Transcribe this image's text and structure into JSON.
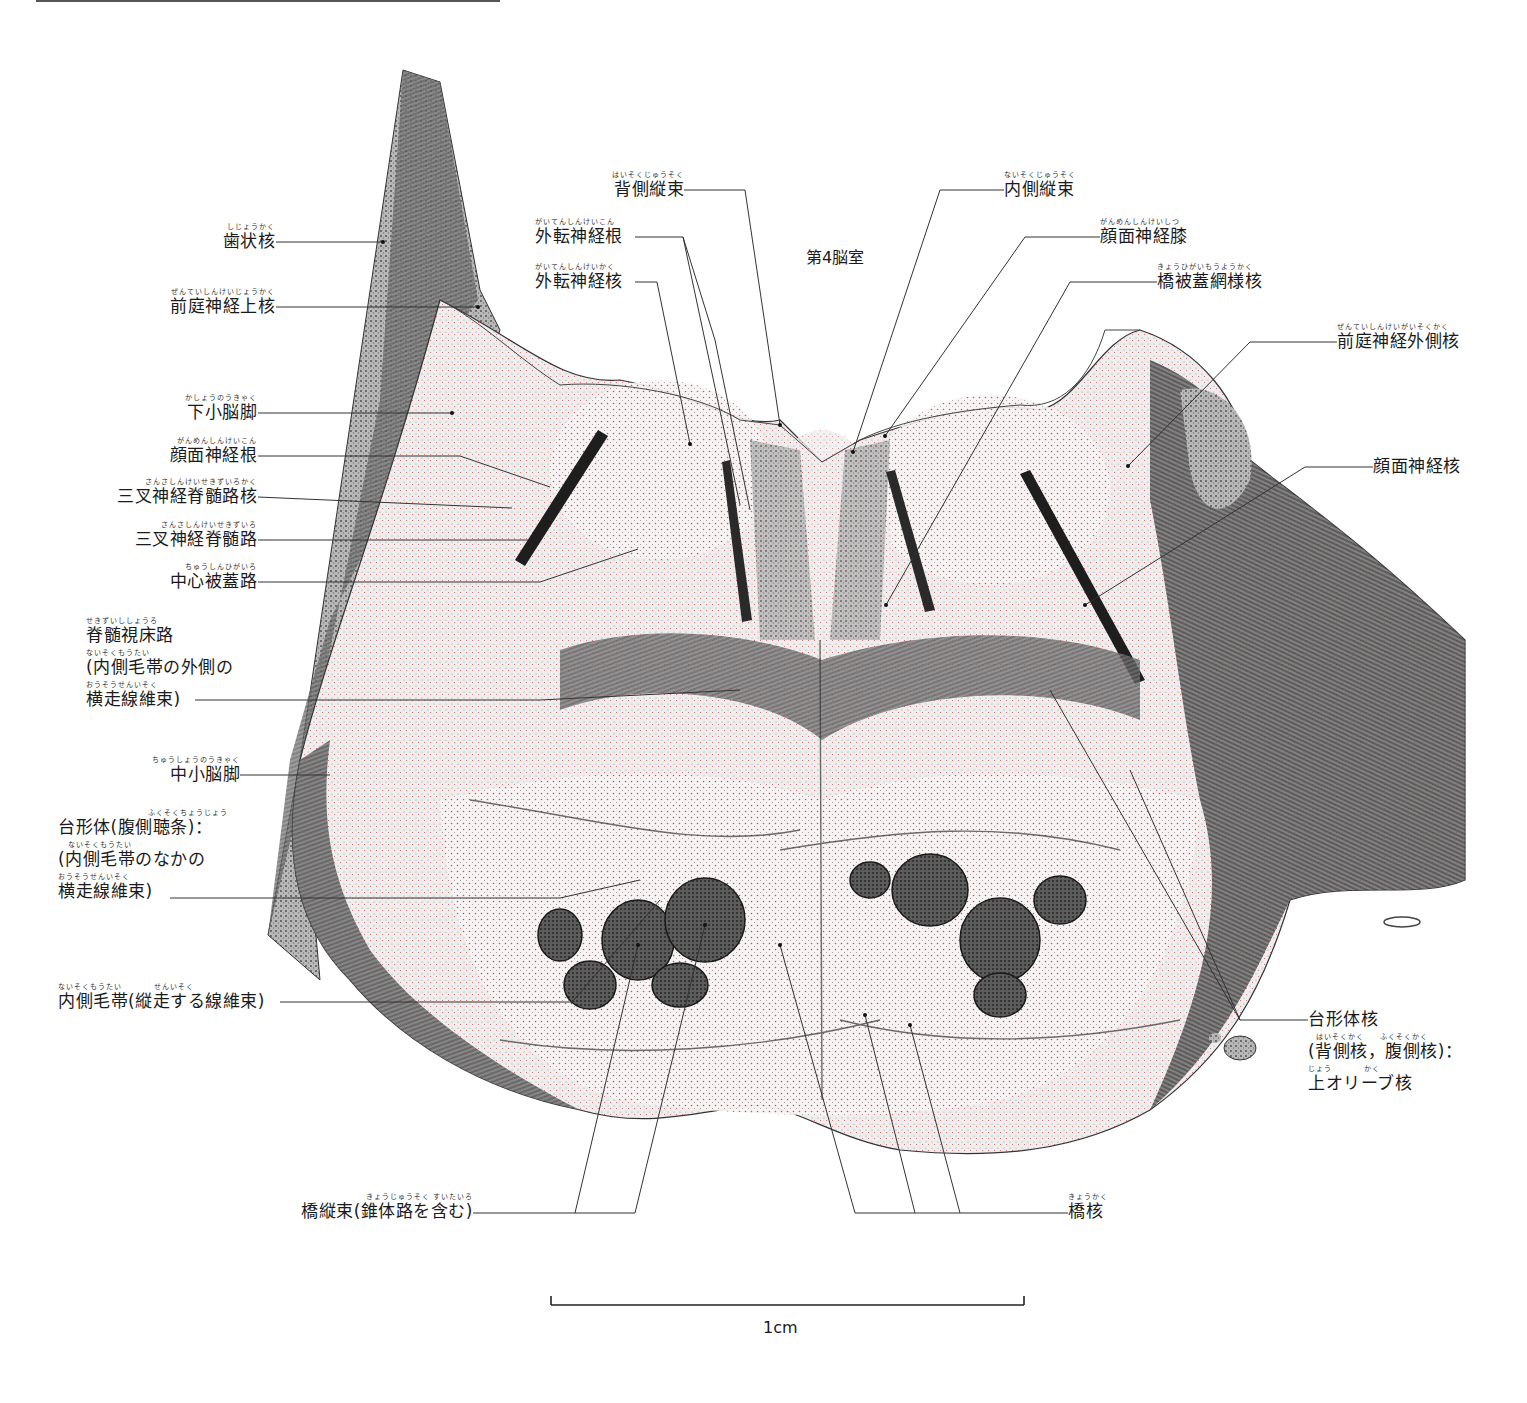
{
  "figure": {
    "top_rule": true,
    "ink_color": "#1a1a1a",
    "accent_dot_color": "#d23a3a",
    "ventricle_label": "第4脳室",
    "scale_bar": {
      "label": "1cm",
      "x1": 551,
      "x2": 1024,
      "y": 1305
    }
  },
  "labels_left": [
    {
      "id": "dentate-nucleus",
      "ruby": "しじょうかく",
      "text": "歯状核",
      "x": 275,
      "y": 242,
      "target": [
        383,
        242
      ]
    },
    {
      "id": "superior-vestibular-nucleus",
      "ruby": "ぜんていしんけいじょうかく",
      "text": "前庭神経上核",
      "x": 275,
      "y": 307,
      "target": [
        478,
        307
      ]
    },
    {
      "id": "inferior-cerebellar-peduncle",
      "ruby": "かしょうのうきゃく",
      "text": "下小脳脚",
      "x": 257,
      "y": 413,
      "target": [
        452,
        413
      ]
    },
    {
      "id": "facial-nerve-root",
      "ruby": "がんめんしんけいこん",
      "text": "顔面神経根",
      "x": 257,
      "y": 456,
      "target": [
        550,
        487
      ]
    },
    {
      "id": "spinal-trigeminal-nucleus",
      "ruby": "さんさしんけいせきずいろかく",
      "text": "三叉神経脊髄路核",
      "x": 257,
      "y": 497,
      "target": [
        512,
        508
      ]
    },
    {
      "id": "spinal-trigeminal-tract",
      "ruby": "さんさしんけいせきずいろ",
      "text": "三叉神経脊髄路",
      "x": 257,
      "y": 540,
      "target": [
        528,
        540
      ]
    },
    {
      "id": "central-tegmental-tract",
      "ruby": "ちゅうしんひがいろ",
      "text": "中心被蓋路",
      "x": 257,
      "y": 582,
      "target": [
        638,
        549
      ]
    },
    {
      "id": "middle-cerebellar-peduncle",
      "ruby": "ちゅうしょうのうきゃく",
      "text": "中小脳脚",
      "x": 240,
      "y": 775,
      "target": [
        330,
        775
      ]
    },
    {
      "id": "pontine-longitudinal-fibers",
      "ruby": "きょうじゅうそく すいたいろ",
      "text": "橋縦束(錐体路を含む)",
      "x": 473,
      "y": 1212
    },
    {
      "id": "medial-lemniscus",
      "ruby": "ないそくもうたい　　　　せんいそく",
      "text": "内側毛帯(縦走する線維束)",
      "x": 280,
      "y": 1002,
      "target": [
        572,
        1002
      ]
    }
  ],
  "labels_left_multi": [
    {
      "id": "spinothalamic-tract",
      "lines": [
        {
          "ruby": "せきずいししょうろ",
          "text": "脊髄視床路"
        },
        {
          "ruby": "ないそくもうたい",
          "text": "(内側毛帯の外側の"
        },
        {
          "ruby": "おうそうせんいそく",
          "text": "横走線維束)"
        }
      ],
      "x": 86,
      "y": 622,
      "line_y": 700,
      "target": [
        740,
        690
      ]
    },
    {
      "id": "trapezoid-body",
      "lines": [
        {
          "ruby": "ふくそくちょうじょう",
          "text": "台形体(腹側聴条)："
        },
        {
          "ruby": "ないそくもうたい",
          "text": "(内側毛帯のなかの"
        },
        {
          "ruby": "おうそうせんいそく",
          "text": "横走線維束)"
        }
      ],
      "x": 58,
      "y": 813,
      "line_y": 898,
      "target": [
        640,
        880
      ]
    }
  ],
  "labels_top": [
    {
      "id": "dorsal-longitudinal-fasciculus",
      "ruby": "はいそくじゅうそく",
      "text": "背側縦束",
      "x": 612,
      "y": 190,
      "target": [
        780,
        425
      ]
    },
    {
      "id": "abducens-nerve-root",
      "ruby": "がいてんしんけいこん",
      "text": "外転神経根",
      "x": 535,
      "y": 237,
      "target": [
        740,
        505
      ]
    },
    {
      "id": "abducens-nucleus",
      "ruby": "がいてんしんけいかく",
      "text": "外転神経核",
      "x": 535,
      "y": 282,
      "target": [
        690,
        444
      ]
    },
    {
      "id": "medial-longitudinal-fasciculus",
      "ruby": "ないそくじゅうそく",
      "text": "内側縦束",
      "x": 1004,
      "y": 190,
      "target": [
        853,
        452
      ]
    },
    {
      "id": "facial-nerve-genu",
      "ruby": "がんめんしんけいしつ",
      "text": "顔面神経膝",
      "x": 1100,
      "y": 237,
      "target": [
        885,
        436
      ]
    },
    {
      "id": "pontine-reticular-nucleus",
      "ruby": "きょうひがいもうようかく",
      "text": "橋被蓋網様核",
      "x": 1157,
      "y": 282,
      "target": [
        886,
        605
      ]
    }
  ],
  "labels_right": [
    {
      "id": "lateral-vestibular-nucleus",
      "ruby": "ぜんていしんけいがいそくかく",
      "text": "前庭神経外側核",
      "x": 1337,
      "y": 342,
      "target": [
        1128,
        466
      ]
    },
    {
      "id": "facial-nucleus",
      "ruby": "",
      "text": "顔面神経核",
      "x": 1373,
      "y": 467,
      "target": [
        1085,
        605
      ]
    },
    {
      "id": "pontine-nuclei",
      "ruby": "きょうかく",
      "text": "橋核",
      "x": 1068,
      "y": 1212
    }
  ],
  "labels_right_multi": [
    {
      "id": "trapezoid-body-nuclei",
      "lines": [
        {
          "ruby": "",
          "text": "台形体核"
        },
        {
          "ruby": "はいそくかく　　ふくそくかく",
          "text": "(背側核，腹側核)："
        },
        {
          "ruby": "じょう　　　　かく",
          "text": "上オリーブ核"
        }
      ],
      "x": 1308,
      "y": 1013,
      "line_y": 1020,
      "target": [
        1130,
        770
      ]
    }
  ]
}
